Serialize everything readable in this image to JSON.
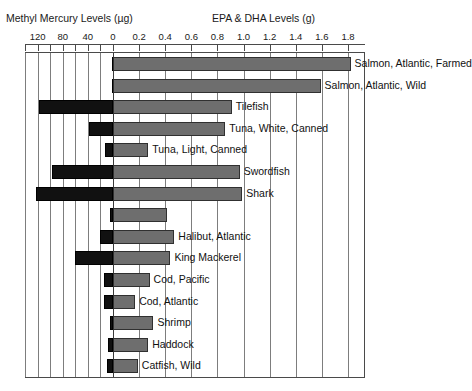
{
  "chart_data": {
    "type": "bar",
    "orientation": "horizontal",
    "style": "bidirectional-paired-bar",
    "title": "",
    "axes": [
      {
        "name": "mercury",
        "label": "Methyl Mercury Levels (µg)",
        "side": "left",
        "direction": "right-to-left",
        "ticks": [
          120,
          80,
          40,
          0
        ],
        "minor_ticks": [
          140,
          100,
          60,
          20
        ],
        "range": [
          0,
          140
        ],
        "units": "µg"
      },
      {
        "name": "epa_dha",
        "label": "EPA & DHA Levels (g)",
        "side": "right",
        "direction": "left-to-right",
        "ticks": [
          0.0,
          0.2,
          0.4,
          0.6,
          0.8,
          1.0,
          1.2,
          1.4,
          1.6,
          1.8
        ],
        "range": [
          0.0,
          1.8
        ],
        "units": "g"
      }
    ],
    "grid": true,
    "legend": null,
    "series": [
      {
        "name": "Methyl Mercury Levels (µg)",
        "color": "#111111",
        "axis": "mercury"
      },
      {
        "name": "EPA & DHA Levels (g)",
        "color": "#6e6e6e",
        "axis": "epa_dha"
      }
    ],
    "categories": [
      "Salmon, Atlantic, Farmed",
      "Salmon, Atlantic, Wild",
      "Tilefish",
      "Tuna, White, Canned",
      "Tuna, Light, Canned",
      "Swordfish",
      "Shark",
      "",
      "Halibut, Atlantic",
      "King Mackerel",
      "Cod, Pacific",
      "Cod, Atlantic",
      "Shrimp",
      "Haddock",
      "Catfish, Wild"
    ],
    "rows": [
      {
        "label": "Salmon, Atlantic, Farmed",
        "mercury": 2,
        "epa_dha": 1.82
      },
      {
        "label": "Salmon, Atlantic, Wild",
        "mercury": 2,
        "epa_dha": 1.59
      },
      {
        "label": "Tilefish",
        "mercury": 118,
        "epa_dha": 0.91
      },
      {
        "label": "Tuna, White, Canned",
        "mercury": 38,
        "epa_dha": 0.86
      },
      {
        "label": "Tuna, Light, Canned",
        "mercury": 12,
        "epa_dha": 0.27
      },
      {
        "label": "Swordfish",
        "mercury": 97,
        "epa_dha": 0.97
      },
      {
        "label": "Shark",
        "mercury": 123,
        "epa_dha": 0.99
      },
      {
        "label": "",
        "mercury": 4,
        "epa_dha": 0.41
      },
      {
        "label": "Halibut, Atlantic",
        "mercury": 20,
        "epa_dha": 0.47
      },
      {
        "label": "King Mackerel",
        "mercury": 60,
        "epa_dha": 0.44
      },
      {
        "label": "Cod, Pacific",
        "mercury": 14,
        "epa_dha": 0.28
      },
      {
        "label": "Cod, Atlantic",
        "mercury": 14,
        "epa_dha": 0.17
      },
      {
        "label": "Shrimp",
        "mercury": 4,
        "epa_dha": 0.31
      },
      {
        "label": "Haddock",
        "mercury": 8,
        "epa_dha": 0.27
      },
      {
        "label": "Catfish, Wild",
        "mercury": 10,
        "epa_dha": 0.19
      }
    ]
  },
  "titles": {
    "mercury_axis": "Methyl Mercury Levels (µg)",
    "epa_axis": "EPA & DHA Levels (g)"
  },
  "mercury_tick_labels": [
    "120",
    "80",
    "40",
    "0"
  ],
  "epa_tick_labels": [
    "0.2",
    "0.4",
    "0.6",
    "0.8",
    "1.0",
    "1.2",
    "1.4",
    "1.6",
    "1.8"
  ],
  "colors": {
    "mercury_bar": "#111111",
    "epa_bar": "#6e6e6e",
    "gridline": "#7d7d7d",
    "axis": "#4a4a4a",
    "background": "#ffffff"
  }
}
